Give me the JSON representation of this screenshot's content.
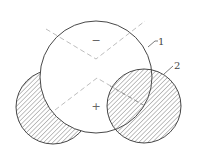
{
  "diagram": {
    "labels": {
      "oxygen": "1",
      "hydrogen": "2"
    },
    "charges": {
      "negative": "−",
      "positive": "+"
    },
    "colors": {
      "stroke": "#333333",
      "dashed": "#b0b0b0",
      "hatch": "#555555",
      "background": "#ffffff"
    }
  }
}
